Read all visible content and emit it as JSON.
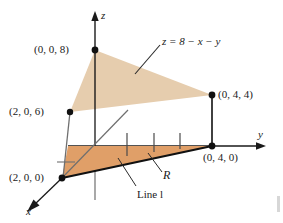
{
  "figure": {
    "type": "3d-coordinate-diagram",
    "background_color": "#ffffff"
  },
  "axes": {
    "x_label": "x",
    "y_label": "y",
    "z_label": "z",
    "axis_color": "#1a1a1a"
  },
  "equation": {
    "text": "z = 8 − x − y"
  },
  "points": [
    {
      "id": "p-0-0-8",
      "label": "(0, 0, 8)"
    },
    {
      "id": "p-2-0-6",
      "label": "(2, 0, 6)"
    },
    {
      "id": "p-0-4-4",
      "label": "(0, 4, 4)"
    },
    {
      "id": "p-2-0-0",
      "label": "(2, 0, 0)"
    },
    {
      "id": "p-0-4-0",
      "label": "(0, 4, 0)"
    }
  ],
  "annotations": {
    "region_label": "R",
    "line_label": "Line l"
  },
  "colors": {
    "plane_fill": "#e6cdae",
    "region_fill": "#e09f68",
    "outline": "#111111",
    "thin_line": "#6f6f6f",
    "text": "#1a1a1a"
  },
  "geometry": {
    "note": "vertices in pixel coordinates of the 283x223 figure",
    "plane_triangle": [
      [
        95,
        50
      ],
      [
        70,
        112
      ],
      [
        212,
        95
      ]
    ],
    "region_triangle": [
      [
        62,
        178
      ],
      [
        212,
        146
      ],
      [
        68,
        146
      ]
    ],
    "tick_count": 3
  }
}
